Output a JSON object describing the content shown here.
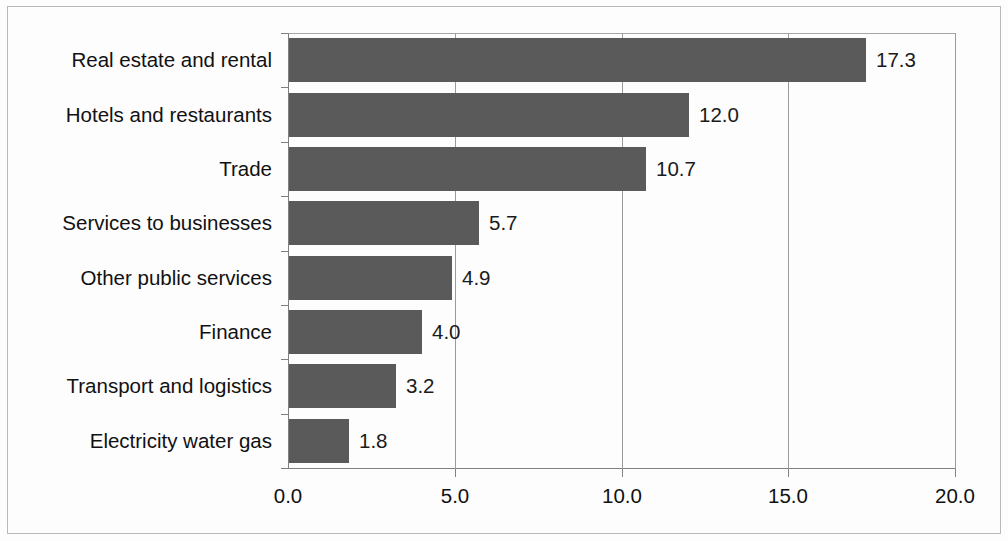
{
  "chart_data": {
    "type": "bar",
    "orientation": "horizontal",
    "title": "",
    "subtitle": "",
    "xlabel": "",
    "ylabel": "",
    "categories": [
      "Real estate and rental",
      "Hotels and restaurants",
      "Trade",
      "Services to businesses",
      "Other public services",
      "Finance",
      "Transport and logistics",
      "Electricity water gas"
    ],
    "values": [
      17.3,
      12.0,
      10.7,
      5.7,
      4.9,
      4.0,
      3.2,
      1.8
    ],
    "value_labels": [
      "17.3",
      "12.0",
      "10.7",
      "5.7",
      "4.9",
      "4.0",
      "3.2",
      "1.8"
    ],
    "xlim": [
      0.0,
      20.0
    ],
    "xticks": [
      0.0,
      5.0,
      10.0,
      15.0,
      20.0
    ],
    "xtick_labels": [
      "0.0",
      "5.0",
      "10.0",
      "15.0",
      "20.0"
    ],
    "grid": "vertical",
    "legend": null,
    "bar_color": "#5a5a5a",
    "gridline_color": "#9a9a9a",
    "axis_color": "#808080",
    "text_color": "#111111",
    "background_color": "#fdfdfd"
  }
}
